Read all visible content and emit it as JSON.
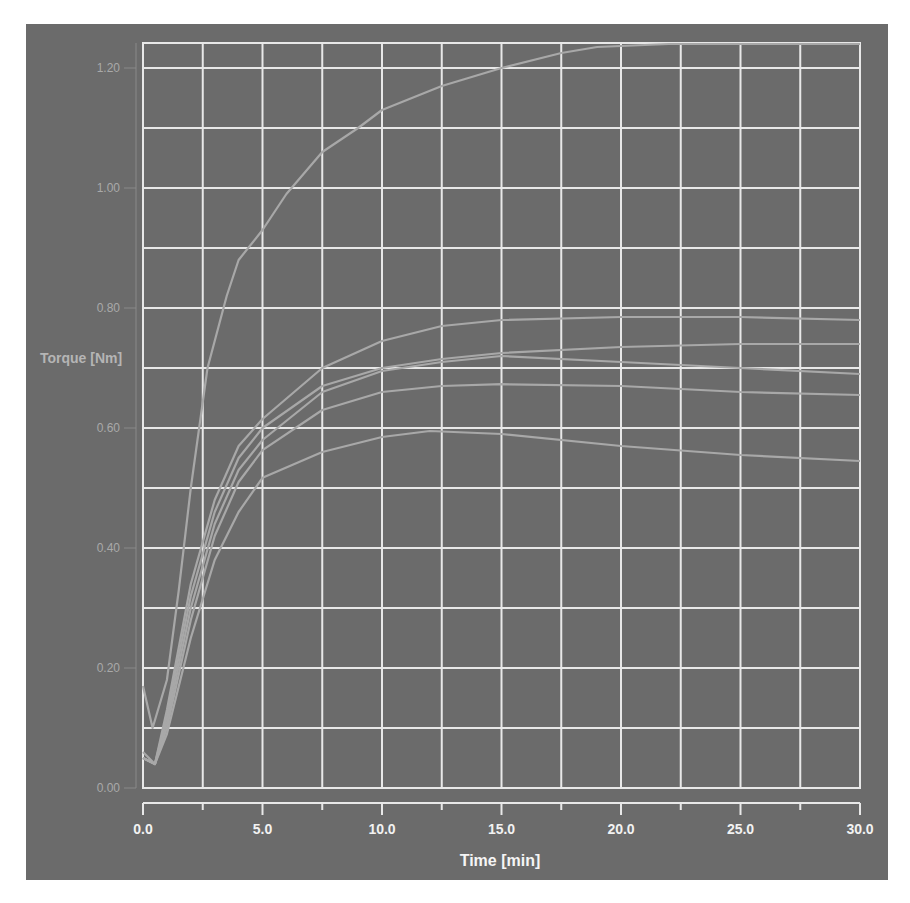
{
  "chart_data": {
    "type": "line",
    "title": "",
    "xlabel": "Time [min]",
    "ylabel": "Torque [Nm]",
    "xlim": [
      0,
      30
    ],
    "ylim": [
      0,
      1.24
    ],
    "grid": true,
    "legend": "none",
    "x_ticks": [
      "0.0",
      "5.0",
      "10.0",
      "15.0",
      "20.0",
      "25.0",
      "30.0"
    ],
    "y_ticks": [
      "0.00",
      "0.20",
      "0.40",
      "0.60",
      "0.80",
      "1.00",
      "1.20"
    ],
    "x_minor_step": 2.5,
    "y_minor_step": 0.1,
    "series": [
      {
        "name": "curve-1",
        "x": [
          0,
          0.4,
          1,
          1.5,
          2,
          2.7,
          3.5,
          4,
          5,
          6,
          7.5,
          9,
          10,
          12.5,
          15,
          17.5,
          19,
          22,
          25,
          30
        ],
        "values": [
          0.17,
          0.1,
          0.18,
          0.33,
          0.5,
          0.7,
          0.82,
          0.88,
          0.93,
          0.99,
          1.06,
          1.1,
          1.13,
          1.17,
          1.2,
          1.225,
          1.235,
          1.24,
          1.24,
          1.24
        ]
      },
      {
        "name": "curve-2",
        "x": [
          0,
          0.5,
          1,
          2,
          3,
          4,
          5,
          7.5,
          10,
          12.5,
          15,
          20,
          25,
          30
        ],
        "values": [
          0.06,
          0.04,
          0.13,
          0.34,
          0.48,
          0.57,
          0.615,
          0.7,
          0.745,
          0.77,
          0.78,
          0.785,
          0.785,
          0.78
        ]
      },
      {
        "name": "curve-3",
        "x": [
          0,
          0.5,
          1,
          2,
          3,
          4,
          5,
          7.5,
          10,
          12.5,
          15,
          20,
          25,
          30
        ],
        "values": [
          0.05,
          0.04,
          0.12,
          0.32,
          0.46,
          0.55,
          0.6,
          0.67,
          0.7,
          0.715,
          0.725,
          0.735,
          0.74,
          0.74
        ]
      },
      {
        "name": "curve-4",
        "x": [
          0,
          0.5,
          1,
          2,
          3,
          4,
          5,
          7.5,
          10,
          12.5,
          15,
          20,
          25,
          30
        ],
        "values": [
          0.05,
          0.04,
          0.11,
          0.3,
          0.44,
          0.53,
          0.58,
          0.66,
          0.695,
          0.71,
          0.72,
          0.71,
          0.7,
          0.69
        ]
      },
      {
        "name": "curve-5",
        "x": [
          0,
          0.5,
          1,
          2,
          3,
          4,
          5,
          7.5,
          10,
          12.5,
          15,
          20,
          25,
          30
        ],
        "values": [
          0.05,
          0.04,
          0.1,
          0.28,
          0.42,
          0.51,
          0.563,
          0.63,
          0.66,
          0.67,
          0.673,
          0.67,
          0.66,
          0.655
        ]
      },
      {
        "name": "curve-6",
        "x": [
          0,
          0.5,
          1,
          2,
          3,
          4,
          5,
          7.5,
          10,
          12,
          15,
          20,
          25,
          30
        ],
        "values": [
          0.05,
          0.04,
          0.09,
          0.25,
          0.38,
          0.46,
          0.517,
          0.56,
          0.585,
          0.595,
          0.59,
          0.57,
          0.555,
          0.545
        ]
      }
    ]
  },
  "colors": {
    "panel_background": "#6b6b6b",
    "page_background": "#ffffff",
    "grid": "#e8e8e8",
    "curve": "#a8a8a8",
    "tick_label_y": "#a9a9a9",
    "tick_label_x": "#f2f2f2"
  }
}
